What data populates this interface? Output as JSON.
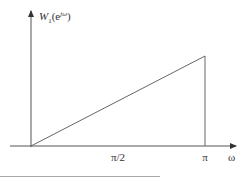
{
  "chart_data": {
    "type": "line",
    "title": "",
    "ylabel": "W1(e^{jω})",
    "ylabel_parts": {
      "base": "W",
      "sub": "1",
      "paren_open": "(e",
      "sup": "jω",
      "paren_close": ")"
    },
    "xlabel": "ω",
    "xlim": [
      0,
      3.14159
    ],
    "ylim": [
      0,
      1.3
    ],
    "x_ticks": [
      {
        "value": 1.5708,
        "label": "π/2"
      },
      {
        "value": 3.14159,
        "label": "π"
      }
    ],
    "series": [
      {
        "name": "W1",
        "points": [
          [
            0,
            0
          ],
          [
            3.14159,
            1
          ],
          [
            3.14159,
            0
          ]
        ]
      }
    ],
    "grid": false,
    "legend": "none"
  }
}
